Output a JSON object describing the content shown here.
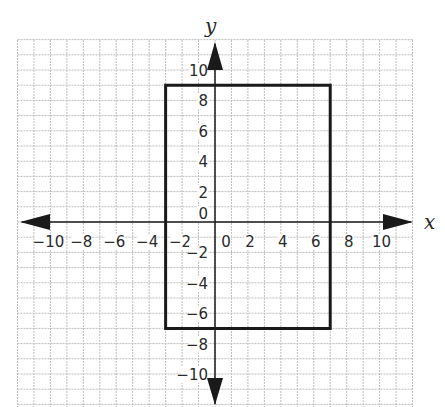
{
  "chart_data": {
    "type": "scatter",
    "title": "",
    "xlabel": "x",
    "ylabel": "y",
    "xlim": [
      -12,
      12
    ],
    "ylim": [
      -12,
      12
    ],
    "grid": true,
    "grid_step": 1,
    "x_ticks": [
      "-10",
      "-8",
      "-6",
      "-4",
      "-2",
      "0",
      "2",
      "4",
      "6",
      "8",
      "10"
    ],
    "y_ticks": [
      "10",
      "8",
      "6",
      "4",
      "2",
      "0",
      "-2",
      "-4",
      "-6",
      "-8",
      "-10"
    ],
    "shapes": [
      {
        "name": "rectangle",
        "vertices": [
          [
            -3,
            9
          ],
          [
            7,
            9
          ],
          [
            7,
            -7
          ],
          [
            -3,
            -7
          ]
        ],
        "stroke": "#1a1a1a"
      }
    ]
  },
  "colors": {
    "grid": "#bdbdbd",
    "axis": "#1a1a1a",
    "shape": "#1a1a1a"
  }
}
